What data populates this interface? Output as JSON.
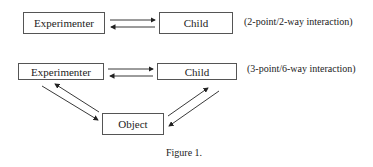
{
  "diagram1": {
    "left_node": "Experimenter",
    "right_node": "Child",
    "note": "(2-point/2-way interaction)"
  },
  "diagram2": {
    "left_node": "Experimenter",
    "right_node": "Child",
    "bottom_node": "Object",
    "note": "(3-point/6-way interaction)"
  },
  "caption": "Figure 1."
}
